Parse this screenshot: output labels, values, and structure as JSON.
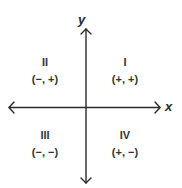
{
  "axes": {
    "x_label": "x",
    "y_label": "y"
  },
  "quadrants": [
    {
      "numeral": "I",
      "signs": "(+, +)"
    },
    {
      "numeral": "II",
      "signs": "(−, +)"
    },
    {
      "numeral": "III",
      "signs": "(−, −)"
    },
    {
      "numeral": "IV",
      "signs": "(+, −)"
    }
  ],
  "colors": {
    "line": "#2a2a2a",
    "text": "#333333",
    "background": "#ffffff"
  }
}
